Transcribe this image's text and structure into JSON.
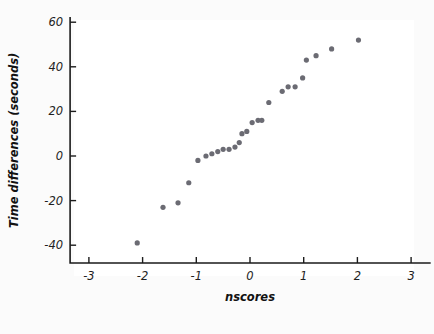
{
  "chart_data": {
    "type": "scatter",
    "title": "",
    "xlabel": "nscores",
    "ylabel": "Time differences (seconds)",
    "xlim": [
      -3.35,
      3.35
    ],
    "ylim": [
      -48,
      62
    ],
    "grid": false,
    "legend": null,
    "point_color": "#6b6b73",
    "point_radius": 2.6,
    "x_ticks": [
      -3,
      -2,
      -1,
      0,
      1,
      2,
      3
    ],
    "x_tick_labels": [
      "-3",
      "-2",
      "-1",
      "0",
      "1",
      "2",
      "3"
    ],
    "y_ticks": [
      -40,
      -20,
      0,
      20,
      40,
      60
    ],
    "y_tick_labels": [
      "-40",
      "-20",
      "0",
      "20",
      "40",
      "60"
    ],
    "series": [
      {
        "name": "time differences vs normal scores",
        "points": [
          {
            "x": -2.1,
            "y": -39
          },
          {
            "x": -1.62,
            "y": -23
          },
          {
            "x": -1.34,
            "y": -21
          },
          {
            "x": -1.14,
            "y": -12
          },
          {
            "x": -0.97,
            "y": -2
          },
          {
            "x": -0.82,
            "y": 0
          },
          {
            "x": -0.71,
            "y": 1
          },
          {
            "x": -0.6,
            "y": 2
          },
          {
            "x": -0.5,
            "y": 3
          },
          {
            "x": -0.39,
            "y": 3
          },
          {
            "x": -0.28,
            "y": 4
          },
          {
            "x": -0.2,
            "y": 6
          },
          {
            "x": -0.15,
            "y": 10
          },
          {
            "x": -0.06,
            "y": 11
          },
          {
            "x": 0.04,
            "y": 15
          },
          {
            "x": 0.15,
            "y": 16
          },
          {
            "x": 0.22,
            "y": 16
          },
          {
            "x": 0.35,
            "y": 24
          },
          {
            "x": 0.6,
            "y": 29
          },
          {
            "x": 0.71,
            "y": 31
          },
          {
            "x": 0.84,
            "y": 31
          },
          {
            "x": 0.98,
            "y": 35
          },
          {
            "x": 1.05,
            "y": 43
          },
          {
            "x": 1.23,
            "y": 45
          },
          {
            "x": 1.52,
            "y": 48
          },
          {
            "x": 2.02,
            "y": 52
          }
        ]
      }
    ]
  },
  "axes": {
    "x_title": "nscores",
    "y_title": "Time differences (seconds)"
  }
}
